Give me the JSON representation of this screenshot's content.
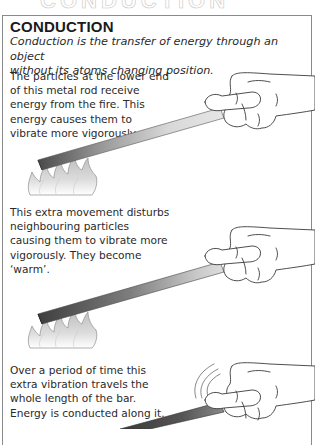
{
  "page": {
    "top_title_partial": "CONDUCTION",
    "section": {
      "heading": "CONDUCTION",
      "definition_lines": [
        "Conduction is the transfer of energy through an object",
        "without its atoms changing position."
      ]
    },
    "panels": [
      {
        "lines": [
          "The particles at the lower end",
          "of this metal rod receive",
          "energy from the fire.  This",
          "energy causes them to",
          "vibrate more vigorously."
        ],
        "illustration": "hand-holding-rod-in-fire"
      },
      {
        "lines": [
          "This extra movement disturbs",
          "neighbouring particles",
          "causing them to vibrate more",
          "vigorously. They become",
          "‘warm’."
        ],
        "illustration": "hand-holding-warming-rod-in-fire"
      },
      {
        "lines": [
          "Over a period of time this",
          "extra vibration travels the",
          "whole length of the bar.",
          "Energy is conducted along it."
        ],
        "illustration": "hand-holding-hot-rod-with-vibration-lines"
      }
    ]
  }
}
